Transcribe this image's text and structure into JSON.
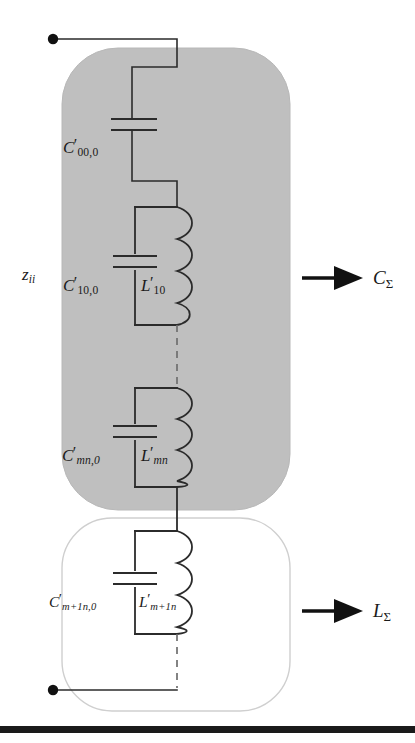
{
  "figure": {
    "type": "circuit-diagram",
    "background_color": "#ffffff",
    "ink_color": "#1a1a1a",
    "group_fill_color": "#bfbfbf",
    "group_border_color": "#cfcfcf"
  },
  "terminals": {
    "top": {
      "name": "top-terminal",
      "x": 53,
      "y": 39
    },
    "bottom": {
      "name": "bottom-terminal",
      "x": 53,
      "y": 690
    }
  },
  "impedance_label": {
    "symbol": "z",
    "subscript": "ii",
    "text": "z_ii"
  },
  "groups": [
    {
      "id": "capacitive-group",
      "fill": "#bfbfbf",
      "arrow_label_symbol": "C",
      "arrow_label_subscript": "Σ",
      "arrow_label_text": "C_Σ"
    },
    {
      "id": "inductive-group",
      "fill": "#ffffff",
      "arrow_label_symbol": "L",
      "arrow_label_subscript": "Σ",
      "arrow_label_text": "L_Σ"
    }
  ],
  "components": [
    {
      "id": "series-capacitor",
      "kind": "capacitor",
      "group": "capacitive-group",
      "symbol": "C",
      "prime": "′",
      "subscript": "00,0",
      "label_text": "C′00,0"
    },
    {
      "id": "lc-block-1",
      "kind": "parallel-lc",
      "group": "capacitive-group",
      "capacitor": {
        "symbol": "C",
        "prime": "′",
        "subscript": "10,0",
        "label_text": "C′10,0"
      },
      "inductor": {
        "symbol": "L",
        "prime": "′",
        "subscript": "10",
        "label_text": "L′10"
      }
    },
    {
      "id": "lc-block-mn",
      "kind": "parallel-lc",
      "group": "capacitive-group",
      "capacitor": {
        "symbol": "C",
        "prime": "′",
        "subscript": "mn,0",
        "label_text": "C′mn,0"
      },
      "inductor": {
        "symbol": "L",
        "prime": "′",
        "subscript": "mn",
        "label_text": "L′mn"
      }
    },
    {
      "id": "lc-block-m1n",
      "kind": "parallel-lc",
      "group": "inductive-group",
      "capacitor": {
        "symbol": "C",
        "prime": "′",
        "subscript": "m+1n,0",
        "label_text": "C′m+1n,0"
      },
      "inductor": {
        "symbol": "L",
        "prime": "′",
        "subscript": "m+1n",
        "label_text": "L′m+1n"
      }
    }
  ],
  "labels": {
    "zii_symbol": "z",
    "zii_sub": "ii",
    "c00_symbol": "C",
    "c00_prime": "′",
    "c00_sub": "00,0",
    "c10_symbol": "C",
    "c10_prime": "′",
    "c10_sub": "10,0",
    "l10_symbol": "L",
    "l10_prime": "′",
    "l10_sub": "10",
    "cmn_symbol": "C",
    "cmn_prime": "′",
    "cmn_sub": "mn,0",
    "lmn_symbol": "L",
    "lmn_prime": "′",
    "lmn_sub": "mn",
    "cm1n_symbol": "C",
    "cm1n_prime": "′",
    "cm1n_sub": "m+1n,0",
    "lm1n_symbol": "L",
    "lm1n_prime": "′",
    "lm1n_sub": "m+1n",
    "csum_symbol": "C",
    "csum_sub": "Σ",
    "lsum_symbol": "L",
    "lsum_sub": "Σ"
  }
}
